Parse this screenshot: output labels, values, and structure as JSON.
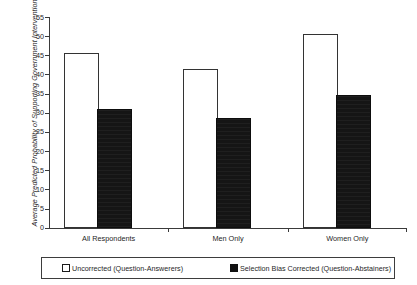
{
  "chart_data": {
    "type": "bar",
    "title": "",
    "xlabel": "",
    "ylabel": "Average Predicted Probability of Supporting Government Intervention",
    "ylim": [
      0,
      55
    ],
    "yticks": [
      0,
      5,
      10,
      15,
      20,
      25,
      30,
      35,
      40,
      45,
      50,
      55
    ],
    "grid": false,
    "legend_position": "bottom",
    "categories": [
      "All Respondents",
      "Men Only",
      "Women Only"
    ],
    "series": [
      {
        "name": "Uncorrected (Question-Answerers)",
        "color": "#ffffff",
        "edge_color": "#333333",
        "values": [
          45,
          41,
          50
        ]
      },
      {
        "name": "Selection Bias Corrected (Question-Abstainers)",
        "color": "#151515",
        "edge_color": "#0d0d0d",
        "values": [
          30.5,
          28,
          34
        ]
      }
    ]
  },
  "axis": {
    "y_title": "Average Predicted Probability of Supporting Government Intervention",
    "tick_labels": [
      "55",
      "50",
      "45",
      "40",
      "35",
      "30",
      "25",
      "20",
      "15",
      "10",
      "5",
      "0"
    ]
  },
  "legend": {
    "uncorrected_label": "Uncorrected (Question-Answerers)",
    "corrected_label": "Selection Bias Corrected (Question-Abstainers)"
  }
}
